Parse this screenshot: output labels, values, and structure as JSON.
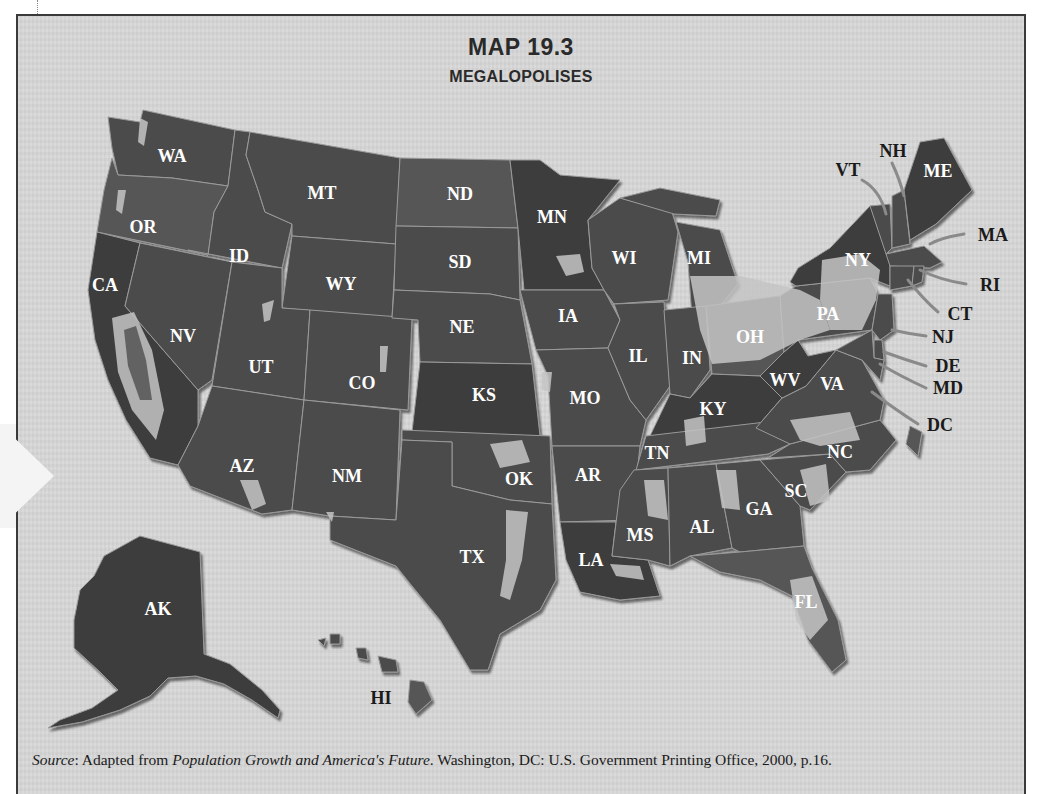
{
  "map": {
    "title": "MAP 19.3",
    "subtitle": "MEGALOPOLISES",
    "colors": {
      "background": "#d6d6d6",
      "state_fill": "#4b4b4b",
      "metro_fill": "#a9a9a9",
      "frame_border": "#3a3a3a"
    },
    "state_labels": [
      {
        "abbr": "WA",
        "x": 172,
        "y": 162
      },
      {
        "abbr": "OR",
        "x": 143,
        "y": 233
      },
      {
        "abbr": "CA",
        "x": 105,
        "y": 291
      },
      {
        "abbr": "ID",
        "x": 239,
        "y": 262
      },
      {
        "abbr": "MT",
        "x": 322,
        "y": 199
      },
      {
        "abbr": "NV",
        "x": 183,
        "y": 342
      },
      {
        "abbr": "UT",
        "x": 261,
        "y": 373
      },
      {
        "abbr": "WY",
        "x": 341,
        "y": 290
      },
      {
        "abbr": "CO",
        "x": 362,
        "y": 389
      },
      {
        "abbr": "AZ",
        "x": 242,
        "y": 472
      },
      {
        "abbr": "NM",
        "x": 347,
        "y": 482
      },
      {
        "abbr": "ND",
        "x": 460,
        "y": 200
      },
      {
        "abbr": "SD",
        "x": 460,
        "y": 268
      },
      {
        "abbr": "NE",
        "x": 462,
        "y": 333
      },
      {
        "abbr": "KS",
        "x": 484,
        "y": 401
      },
      {
        "abbr": "OK",
        "x": 519,
        "y": 485
      },
      {
        "abbr": "TX",
        "x": 472,
        "y": 563
      },
      {
        "abbr": "MN",
        "x": 552,
        "y": 223
      },
      {
        "abbr": "IA",
        "x": 568,
        "y": 322
      },
      {
        "abbr": "MO",
        "x": 585,
        "y": 404
      },
      {
        "abbr": "AR",
        "x": 588,
        "y": 481
      },
      {
        "abbr": "LA",
        "x": 591,
        "y": 566
      },
      {
        "abbr": "WI",
        "x": 624,
        "y": 264
      },
      {
        "abbr": "IL",
        "x": 638,
        "y": 362
      },
      {
        "abbr": "MI",
        "x": 699,
        "y": 264
      },
      {
        "abbr": "IN",
        "x": 692,
        "y": 364
      },
      {
        "abbr": "OH",
        "x": 750,
        "y": 343
      },
      {
        "abbr": "KY",
        "x": 713,
        "y": 415
      },
      {
        "abbr": "TN",
        "x": 657,
        "y": 459
      },
      {
        "abbr": "MS",
        "x": 640,
        "y": 541
      },
      {
        "abbr": "AL",
        "x": 702,
        "y": 533
      },
      {
        "abbr": "GA",
        "x": 759,
        "y": 515
      },
      {
        "abbr": "FL",
        "x": 806,
        "y": 608
      },
      {
        "abbr": "SC",
        "x": 796,
        "y": 497
      },
      {
        "abbr": "NC",
        "x": 840,
        "y": 458
      },
      {
        "abbr": "VA",
        "x": 832,
        "y": 390
      },
      {
        "abbr": "WV",
        "x": 785,
        "y": 386
      },
      {
        "abbr": "PA",
        "x": 828,
        "y": 320
      },
      {
        "abbr": "NY",
        "x": 858,
        "y": 266
      },
      {
        "abbr": "ME",
        "x": 938,
        "y": 177
      },
      {
        "abbr": "AK",
        "x": 158,
        "y": 615
      }
    ],
    "callout_labels": [
      {
        "abbr": "VT",
        "x": 848,
        "y": 176
      },
      {
        "abbr": "NH",
        "x": 893,
        "y": 157
      },
      {
        "abbr": "MA",
        "x": 993,
        "y": 241
      },
      {
        "abbr": "RI",
        "x": 990,
        "y": 291
      },
      {
        "abbr": "CT",
        "x": 960,
        "y": 320
      },
      {
        "abbr": "NJ",
        "x": 943,
        "y": 343
      },
      {
        "abbr": "DE",
        "x": 948,
        "y": 372
      },
      {
        "abbr": "MD",
        "x": 948,
        "y": 394
      },
      {
        "abbr": "DC",
        "x": 940,
        "y": 431
      },
      {
        "abbr": "HI",
        "x": 381,
        "y": 704
      }
    ],
    "source": {
      "label": "Source",
      "text_before_title": ": Adapted from ",
      "title": "Population Growth and America's Future",
      "text_after_title": ". Washington, DC: U.S. Government Printing Office, 2000, p.16."
    }
  }
}
